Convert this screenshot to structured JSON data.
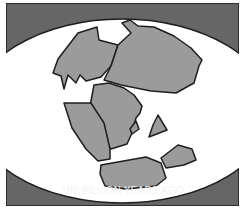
{
  "panel": {
    "caption": "180 BILLION YEARS AGO",
    "colors": {
      "background": "#666666",
      "globe": "#ffffff",
      "land": "#9b9b9b",
      "outline": "#1e1e1e",
      "caption_text": "#f2f2f2"
    }
  }
}
